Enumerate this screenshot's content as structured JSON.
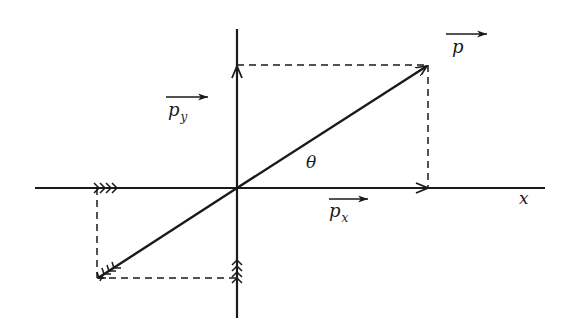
{
  "diagram": {
    "type": "vector-decomposition",
    "colors": {
      "ink": "#1a1a1a",
      "background": "#ffffff"
    },
    "origin": [
      237,
      188
    ],
    "axes": {
      "x_axis": {
        "label": "x",
        "from": [
          35,
          188
        ],
        "to": [
          545,
          188
        ]
      },
      "y_axis": {
        "from": [
          237,
          29
        ],
        "to": [
          237,
          318
        ]
      }
    },
    "vectors": [
      {
        "name": "p",
        "from": [
          237,
          188
        ],
        "to": [
          428,
          65
        ],
        "label": "p",
        "arrow": "single"
      },
      {
        "name": "p_x",
        "from": [
          237,
          188
        ],
        "to": [
          428,
          188
        ],
        "label": "p",
        "subscript": "x",
        "arrow": "single"
      },
      {
        "name": "p_y",
        "from": [
          237,
          188
        ],
        "to": [
          237,
          65
        ],
        "label": "p",
        "subscript": "y",
        "arrow": "single"
      },
      {
        "name": "neg_p",
        "from": [
          237,
          188
        ],
        "to": [
          98,
          278
        ],
        "arrow": "triple-feathered"
      },
      {
        "name": "neg_p_x",
        "at": [
          97,
          188
        ],
        "arrow": "triple-feathered"
      },
      {
        "name": "neg_p_y",
        "at": [
          237,
          278
        ],
        "arrow": "triple-feathered"
      }
    ],
    "dashed_lines": [
      {
        "from": [
          237,
          65
        ],
        "to": [
          428,
          65
        ]
      },
      {
        "from": [
          428,
          65
        ],
        "to": [
          428,
          188
        ]
      },
      {
        "from": [
          97,
          188
        ],
        "to": [
          97,
          278
        ]
      },
      {
        "from": [
          97,
          278
        ],
        "to": [
          237,
          278
        ]
      }
    ],
    "labels": {
      "p": {
        "text": "p",
        "subscript": ""
      },
      "p_x": {
        "text": "p",
        "subscript": "x"
      },
      "p_y": {
        "text": "p",
        "subscript": "y"
      },
      "theta": {
        "text": "θ"
      },
      "x_axis": {
        "text": "x"
      }
    }
  }
}
